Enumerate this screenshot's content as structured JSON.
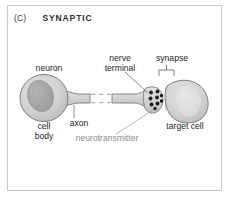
{
  "panel": {
    "letter": "(C)",
    "title": "SYNAPTIC"
  },
  "labels": {
    "neuron": "neuron",
    "cell_body_line1": "cell",
    "cell_body_line2": "body",
    "axon": "axon",
    "nerve_terminal_line1": "nerve",
    "nerve_terminal_line2": "terminal",
    "synapse": "synapse",
    "neurotransmitter": "neurotransmitter",
    "target_cell": "target cell"
  },
  "colors": {
    "border": "#c9c9c9",
    "background": "#ffffff",
    "cell_fill": "#d2d2d2",
    "cell_stroke": "#7d7d7d",
    "nucleus_fill": "#a8a8a8",
    "target_highlight": "#dcdcdc",
    "vesicle": "#1a1a1a",
    "label_text": "#1d1d1d",
    "label_gray": "#8a8a8a",
    "leader_line": "#6e6e6e",
    "title_text": "#2e2e2e"
  },
  "diagram": {
    "type": "synaptic-signaling-schematic",
    "parts": [
      "neuron cell body",
      "axon",
      "axon break",
      "nerve terminal",
      "neurotransmitter vesicles",
      "synapse",
      "target cell"
    ],
    "vesicle_count": 9
  }
}
